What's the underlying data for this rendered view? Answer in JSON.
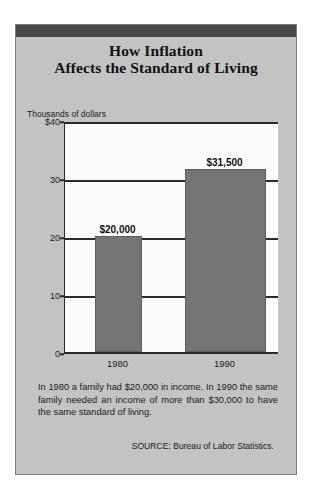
{
  "figure": {
    "title_line1": "How Inflation",
    "title_line2": "Affects the Standard of Living",
    "caption": "In 1980 a family had $20,000 in income. In 1990 the same family needed an income of more than $30,000 to have the same standard of living.",
    "source": "SOURCE: Bureau of Labor Statistics.",
    "frame_color": "#c3c3c3",
    "band_color": "#4a4a4a",
    "bar_color": "#757575",
    "plot_bg": "#fcfcfc",
    "axis_color": "#2b2b2b"
  },
  "chart_data": {
    "type": "bar",
    "title": "How Inflation Affects the Standard of Living",
    "categories": [
      "1980",
      "1990"
    ],
    "values": [
      20000,
      31500
    ],
    "data_labels": [
      "$20,000",
      "$31,500"
    ],
    "xlabel": "",
    "ylabel": "Thousands of dollars",
    "ylim": [
      0,
      40
    ],
    "yticks": [
      0,
      10,
      20,
      30,
      40
    ],
    "ytick_labels": [
      "0",
      "10",
      "20",
      "30",
      "$40"
    ],
    "grid": true,
    "legend": null,
    "units": "thousands of dollars",
    "annotations": [
      "In 1980 a family had $20,000 in income. In 1990 the same family needed an income of more than $30,000 to have the same standard of living.",
      "SOURCE: Bureau of Labor Statistics."
    ]
  }
}
